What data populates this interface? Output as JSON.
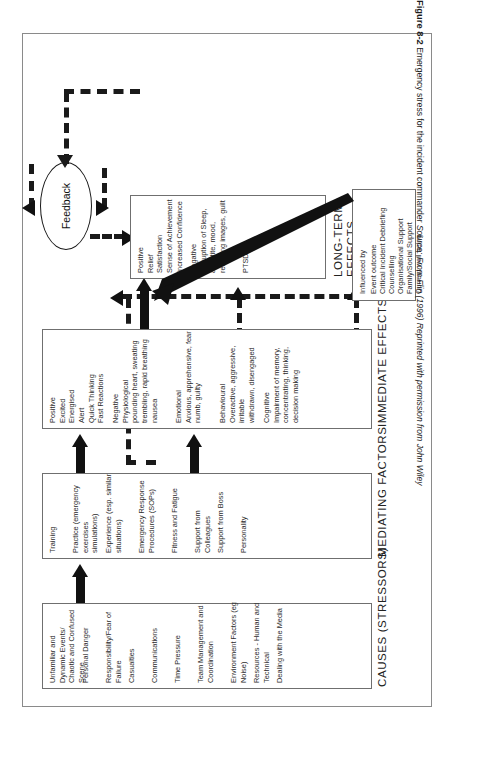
{
  "figure": {
    "number": "Figure 8-2",
    "caption": "Emergency stress for the incident commander",
    "source_label": "Source: From Flin (1996) Reprinted with permission from John Wiley"
  },
  "feedback": {
    "label": "Feedback"
  },
  "stages": [
    {
      "id": "causes",
      "title": "CAUSES (STRESSORS)",
      "groups": [
        {
          "lines": "Unfamiliar and Dynamic Events/\nChaotic and Confused Scene"
        },
        {
          "lines": "Personal Danger"
        },
        {
          "lines": "Responsibility/Fear of Failure"
        },
        {
          "lines": "Casualties"
        },
        {
          "lines": "Communications"
        },
        {
          "lines": "Time Pressure"
        },
        {
          "lines": "Team Management and\nCoordination"
        },
        {
          "lines": "Environment Factors (eg Noise)"
        },
        {
          "lines": "Resources - Human and Technical"
        },
        {
          "lines": "Dealing with the Media"
        }
      ]
    },
    {
      "id": "mediating",
      "title": "MEDIATING FACTORS",
      "groups": [
        {
          "lines": "Training"
        },
        {
          "lines": "Practice (emergency exercises\nsimulations)"
        },
        {
          "lines": "Experience (esp. similar\nsituations)"
        },
        {
          "lines": "Emergency Response\nProcedures (SOPs)"
        },
        {
          "lines": "Fitness and Fatigue"
        },
        {
          "lines": "Support from Colleagues"
        },
        {
          "lines": "Support from Boss"
        },
        {
          "lines": "Personality"
        }
      ]
    },
    {
      "id": "immediate",
      "title": "IMMEDIATE EFFECTS",
      "groups": [
        {
          "lines": "Positive\nExcited\nEnergised\nAlert\nQuick Thinking\nFast Reactions"
        },
        {
          "lines": "Negative\nPhysiological\npounding heart, sweating\ntrembling, rapid breathing\nnausea"
        },
        {
          "lines": "Emotional\nAnxious, apprehensive, fear\nnumb, guilty"
        },
        {
          "lines": "Behavioural\nOveractive, aggressive, irritable\nwithdrawn, disengaged"
        },
        {
          "lines": "Cognitive\nImpairment of memory,\nconcentrating, thinking,\ndecision making"
        }
      ]
    },
    {
      "id": "longterm",
      "title": "LONG-TERM\nEFFECTS",
      "groups": [
        {
          "lines": "Positive\nRelief\nSatisfaction\nSense of Achievement\nIncreased Confidence"
        },
        {
          "lines": "Negative\nDisruption of Sleep,\nappetite, mood,\nrecurring images, guilt"
        },
        {
          "lines": "PTSD"
        }
      ]
    }
  ],
  "influenced": {
    "heading": "Influenced by",
    "items": [
      "Event outcome",
      "Critical Incident Debriefing",
      "Counselling",
      "Organisational Support",
      "Family/Social Support",
      "Current well being"
    ]
  },
  "colors": {
    "ink": "#1a1a1a",
    "box_border": "#6f6f6f",
    "page_border": "#8a8a8a",
    "background": "#ffffff"
  }
}
